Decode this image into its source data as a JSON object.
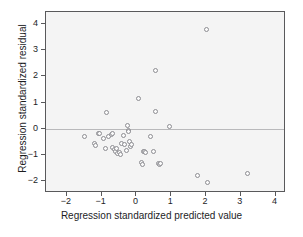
{
  "chart_data": {
    "type": "scatter",
    "title": "",
    "subtitle": "",
    "xlabel": "Regression standardized predicted value",
    "ylabel": "Regression standardized residual",
    "xlim": [
      -2.6,
      4.3
    ],
    "ylim": [
      -2.45,
      4.45
    ],
    "xticks": [
      -2,
      -1,
      0,
      1,
      2,
      3,
      4
    ],
    "xticklabels": [
      "-2",
      "-1",
      "0",
      "1",
      "2",
      "3",
      "4"
    ],
    "yticks": [
      -2,
      -1,
      0,
      1,
      2,
      3,
      4
    ],
    "yticklabels": [
      "-2",
      "-1",
      "0",
      "1",
      "2",
      "3",
      "4"
    ],
    "grid": false,
    "legend": null,
    "reference_lines": [
      {
        "orientation": "horizontal",
        "value": 0,
        "color": "#b9b9bb"
      }
    ],
    "marker": {
      "shape": "circle-open",
      "edge_color": "#8d8d92",
      "fill_color": "#fbfbfb",
      "size_px": 5
    },
    "plot_area_background": "#f4f4f4",
    "frame_color": "#59595b",
    "points": [
      {
        "x": -1.5,
        "y": -0.28
      },
      {
        "x": -1.22,
        "y": -0.58
      },
      {
        "x": -1.18,
        "y": -0.64
      },
      {
        "x": -1.1,
        "y": -0.2
      },
      {
        "x": -1.06,
        "y": -0.2
      },
      {
        "x": -0.94,
        "y": -0.38
      },
      {
        "x": -0.9,
        "y": -0.75
      },
      {
        "x": -0.86,
        "y": 0.62
      },
      {
        "x": -0.8,
        "y": -0.3
      },
      {
        "x": -0.72,
        "y": -0.22
      },
      {
        "x": -0.7,
        "y": -0.2
      },
      {
        "x": -0.68,
        "y": -0.72
      },
      {
        "x": -0.64,
        "y": -0.8
      },
      {
        "x": -0.6,
        "y": -0.88
      },
      {
        "x": -0.58,
        "y": -0.74
      },
      {
        "x": -0.54,
        "y": -0.95
      },
      {
        "x": -0.5,
        "y": -0.92
      },
      {
        "x": -0.46,
        "y": -0.98
      },
      {
        "x": -0.42,
        "y": -0.55
      },
      {
        "x": -0.38,
        "y": -0.25
      },
      {
        "x": -0.34,
        "y": -0.62
      },
      {
        "x": -0.3,
        "y": -0.82
      },
      {
        "x": -0.26,
        "y": 0.12
      },
      {
        "x": -0.24,
        "y": -0.05
      },
      {
        "x": -0.22,
        "y": -0.1
      },
      {
        "x": -0.2,
        "y": -0.48
      },
      {
        "x": -0.16,
        "y": -0.68
      },
      {
        "x": -0.14,
        "y": -0.62
      },
      {
        "x": 0.06,
        "y": 1.14
      },
      {
        "x": 0.14,
        "y": -1.3
      },
      {
        "x": 0.18,
        "y": -1.38
      },
      {
        "x": 0.2,
        "y": -0.88
      },
      {
        "x": 0.24,
        "y": -0.86
      },
      {
        "x": 0.26,
        "y": -0.9
      },
      {
        "x": 0.4,
        "y": -0.3
      },
      {
        "x": 0.48,
        "y": -0.85
      },
      {
        "x": 0.54,
        "y": 2.22
      },
      {
        "x": 0.56,
        "y": 0.66
      },
      {
        "x": 0.62,
        "y": -1.32
      },
      {
        "x": 0.66,
        "y": -1.38
      },
      {
        "x": 0.68,
        "y": -1.34
      },
      {
        "x": 0.94,
        "y": 0.1
      },
      {
        "x": 1.76,
        "y": -1.78
      },
      {
        "x": 2.02,
        "y": 3.78
      },
      {
        "x": 2.04,
        "y": -2.06
      },
      {
        "x": 3.2,
        "y": -1.7
      }
    ]
  }
}
